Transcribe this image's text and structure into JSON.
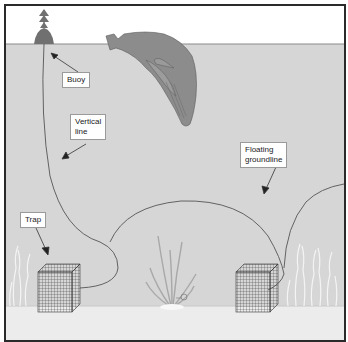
{
  "diagram": {
    "type": "illustration",
    "colors": {
      "sky": "#ffffff",
      "water": "#d6d6d6",
      "seafloor": "#ececec",
      "whale": "#8c8c8c",
      "buoy": "#707070",
      "line": "#555555",
      "frame": "#2a2a2a"
    },
    "labels": [
      {
        "id": "buoy",
        "text": "Buoy"
      },
      {
        "id": "vertical-line",
        "text": "Vertical\nline"
      },
      {
        "id": "floating-groundline",
        "text": "Floating\ngroundline"
      },
      {
        "id": "trap",
        "text": "Trap"
      }
    ],
    "elements": [
      "buoy",
      "whale",
      "vertical-line",
      "floating-groundline",
      "trap-left",
      "trap-right",
      "seaweed",
      "snail"
    ]
  }
}
